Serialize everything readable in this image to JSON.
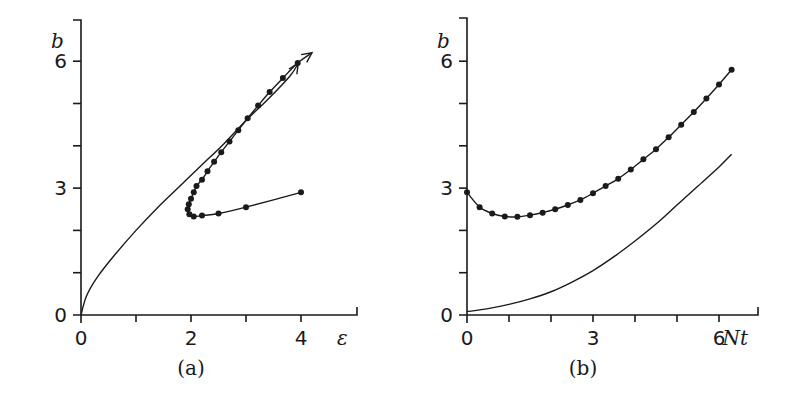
{
  "chart_data": [
    {
      "panel": "(a)",
      "type": "line",
      "xlabel": "ε",
      "ylabel": "b",
      "xlim": [
        0,
        5
      ],
      "ylim": [
        0,
        7
      ],
      "x_ticks": [
        0,
        1,
        2,
        3,
        4,
        5
      ],
      "x_tick_labels": [
        "0",
        "2",
        "4"
      ],
      "x_tick_label_values": [
        0,
        2,
        4
      ],
      "y_ticks": [
        0,
        1,
        2,
        3,
        4,
        5,
        6
      ],
      "y_tick_labels": [
        "0",
        "3",
        "6"
      ],
      "y_tick_label_values": [
        0,
        3,
        6
      ],
      "grid": false,
      "series": [
        {
          "name": "plain curve",
          "markers": false,
          "arrow_end": true,
          "x": [
            0,
            0.1,
            0.3,
            0.6,
            1.0,
            1.4,
            1.8,
            2.2,
            2.6,
            3.0,
            3.4,
            3.8,
            3.95
          ],
          "y": [
            0,
            0.45,
            0.9,
            1.4,
            2.0,
            2.55,
            3.05,
            3.55,
            4.05,
            4.6,
            5.1,
            5.65,
            5.95
          ]
        },
        {
          "name": "dotted curve",
          "markers": true,
          "arrow_end": true,
          "x": [
            4.0,
            3.0,
            2.5,
            2.2,
            2.05,
            1.97,
            1.94,
            1.96,
            2.0,
            2.05,
            2.1,
            2.2,
            2.3,
            2.42,
            2.55,
            2.7,
            2.86,
            3.03,
            3.22,
            3.43,
            3.67,
            3.94,
            4.2
          ],
          "y": [
            2.9,
            2.55,
            2.4,
            2.35,
            2.33,
            2.38,
            2.5,
            2.62,
            2.75,
            2.9,
            3.05,
            3.2,
            3.4,
            3.62,
            3.85,
            4.1,
            4.37,
            4.65,
            4.95,
            5.27,
            5.6,
            5.96,
            6.2
          ]
        }
      ]
    },
    {
      "panel": "(b)",
      "type": "line",
      "xlabel": "Nt",
      "ylabel": "b",
      "xlim": [
        0,
        7
      ],
      "ylim": [
        0,
        7
      ],
      "x_ticks": [
        0,
        1,
        2,
        3,
        4,
        5,
        6,
        7
      ],
      "x_tick_labels": [
        "0",
        "3",
        "6"
      ],
      "x_tick_label_values": [
        0,
        3,
        6
      ],
      "y_ticks": [
        0,
        1,
        2,
        3,
        4,
        5,
        6
      ],
      "y_tick_labels": [
        "0",
        "3",
        "6"
      ],
      "y_tick_label_values": [
        0,
        3,
        6
      ],
      "grid": false,
      "series": [
        {
          "name": "dotted curve",
          "markers": true,
          "x": [
            0,
            0.3,
            0.6,
            0.9,
            1.2,
            1.5,
            1.8,
            2.1,
            2.4,
            2.7,
            3.0,
            3.3,
            3.6,
            3.9,
            4.2,
            4.5,
            4.8,
            5.1,
            5.4,
            5.7,
            6.0,
            6.3
          ],
          "y": [
            2.9,
            2.55,
            2.4,
            2.33,
            2.32,
            2.36,
            2.42,
            2.5,
            2.6,
            2.72,
            2.88,
            3.05,
            3.22,
            3.44,
            3.68,
            3.92,
            4.2,
            4.5,
            4.8,
            5.12,
            5.45,
            5.8
          ]
        },
        {
          "name": "plain curve",
          "markers": false,
          "x": [
            0,
            0.5,
            1.0,
            1.5,
            2.0,
            2.5,
            3.0,
            3.5,
            4.0,
            4.5,
            5.0,
            5.5,
            6.0,
            6.3
          ],
          "y": [
            0.08,
            0.15,
            0.25,
            0.38,
            0.55,
            0.78,
            1.05,
            1.38,
            1.75,
            2.15,
            2.6,
            3.05,
            3.5,
            3.8
          ]
        }
      ]
    }
  ],
  "labels": {
    "a": {
      "caption": "(a)",
      "xvar": "ε",
      "yvar": "b"
    },
    "b": {
      "caption": "(b)",
      "xvar": "Nt",
      "yvar": "b"
    }
  }
}
